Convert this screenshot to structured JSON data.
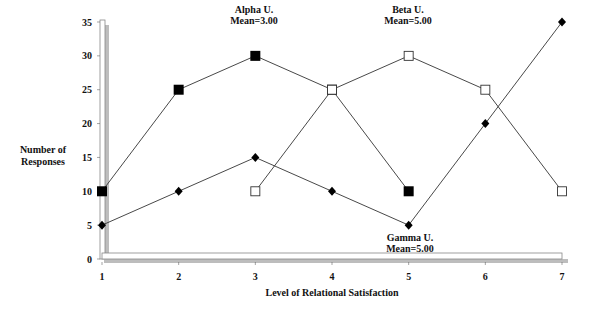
{
  "chart_data": {
    "type": "line",
    "title": "",
    "xlabel": "Level of Relational Satisfaction",
    "ylabel": "Number of Responses",
    "ylabel_lines": [
      "Number of",
      "Responses"
    ],
    "x": [
      1,
      2,
      3,
      4,
      5,
      6,
      7
    ],
    "xticks": [
      "1",
      "2",
      "3",
      "4",
      "5",
      "6",
      "7"
    ],
    "yticks": [
      "0",
      "5",
      "10",
      "15",
      "20",
      "25",
      "30",
      "35"
    ],
    "ylim": [
      0,
      35
    ],
    "xlim": [
      1,
      7
    ],
    "grid": false,
    "legend": "none (inline annotations)",
    "series": [
      {
        "name": "Alpha U.",
        "annotation": [
          "Alpha U.",
          "Mean=3.00"
        ],
        "marker": "filled-square",
        "x": [
          1,
          2,
          3,
          4,
          5
        ],
        "values": [
          10,
          25,
          30,
          25,
          10
        ]
      },
      {
        "name": "Beta U.",
        "annotation": [
          "Beta U.",
          "Mean=5.00"
        ],
        "marker": "open-square",
        "x": [
          3,
          4,
          5,
          6,
          7
        ],
        "values": [
          10,
          25,
          30,
          25,
          10
        ]
      },
      {
        "name": "Gamma U.",
        "annotation": [
          "Gamma U.",
          "Mean=5.00"
        ],
        "marker": "filled-diamond",
        "x": [
          1,
          2,
          3,
          4,
          5,
          6,
          7
        ],
        "values": [
          5,
          10,
          15,
          10,
          5,
          20,
          35
        ]
      }
    ]
  }
}
